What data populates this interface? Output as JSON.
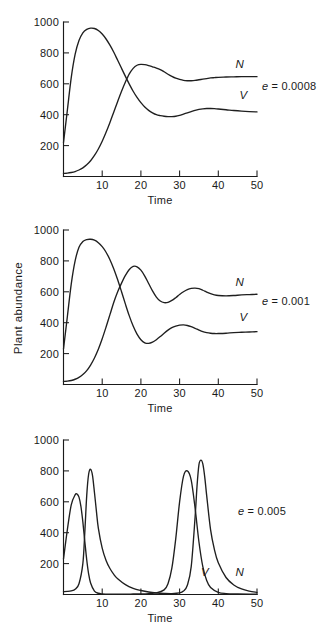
{
  "figure": {
    "name": "plant-abundance-time-series",
    "y_axis_label": "Plant abundance",
    "x_axis_label": "Time",
    "y_ticks": [
      0,
      200,
      400,
      600,
      800,
      1000
    ],
    "y_tick_labels": [
      "",
      "200",
      "400",
      "600",
      "800",
      "1000"
    ],
    "x_ticks": [
      0,
      10,
      20,
      30,
      40,
      50
    ],
    "x_tick_labels": [
      "",
      "10",
      "20",
      "30",
      "40",
      "50"
    ],
    "series_labels": {
      "n": "N",
      "v": "V"
    },
    "line_color": "#1f1f1f"
  },
  "panels": [
    {
      "id": "panel-0",
      "param_prefix": "e",
      "param_eq": " = ",
      "param_value": "0.0008",
      "param_text": "e = 0.0008",
      "show_ylabel": false,
      "label_n": "N",
      "label_v": "V"
    },
    {
      "id": "panel-1",
      "param_prefix": "e",
      "param_eq": " = ",
      "param_value": "0.001",
      "param_text": "e = 0.001",
      "show_ylabel": true,
      "label_n": "N",
      "label_v": "V"
    },
    {
      "id": "panel-2",
      "param_prefix": "e",
      "param_eq": " = ",
      "param_value": "0.005",
      "param_text": "e = 0.005",
      "show_ylabel": false,
      "label_n": "N",
      "label_v": "V"
    }
  ],
  "chart_data": [
    {
      "type": "line",
      "title": "e = 0.0008",
      "xlabel": "Time",
      "ylabel": "",
      "xlim": [
        0,
        50
      ],
      "ylim": [
        0,
        1000
      ],
      "grid": false,
      "legend": "inline-curve-labels",
      "x_ticks": [
        10,
        20,
        30,
        40,
        50
      ],
      "y_ticks": [
        200,
        400,
        600,
        800,
        1000
      ],
      "series": [
        {
          "name": "V",
          "label_position": {
            "x": 46.5,
            "y": 500
          },
          "x": [
            0,
            1,
            2,
            3,
            4,
            5,
            6,
            7,
            8,
            9,
            10,
            11,
            12,
            13,
            14,
            15,
            16,
            17,
            18,
            19,
            20,
            21,
            22,
            23,
            24,
            25,
            26,
            27,
            28,
            29,
            30,
            31,
            32,
            33,
            34,
            35,
            36,
            37,
            38,
            39,
            40,
            42,
            44,
            46,
            48,
            50
          ],
          "y": [
            220,
            430,
            640,
            790,
            880,
            930,
            952,
            960,
            958,
            945,
            922,
            890,
            850,
            804,
            752,
            700,
            648,
            598,
            552,
            512,
            478,
            450,
            428,
            412,
            400,
            394,
            390,
            388,
            388,
            390,
            396,
            404,
            412,
            420,
            428,
            434,
            438,
            440,
            440,
            439,
            437,
            432,
            427,
            423,
            420,
            418
          ]
        },
        {
          "name": "N",
          "label_position": {
            "x": 45.5,
            "y": 700
          },
          "x": [
            0,
            1,
            2,
            3,
            4,
            5,
            6,
            7,
            8,
            9,
            10,
            11,
            12,
            13,
            14,
            15,
            16,
            17,
            18,
            19,
            20,
            21,
            22,
            23,
            24,
            25,
            26,
            27,
            28,
            29,
            30,
            31,
            32,
            33,
            34,
            35,
            36,
            37,
            38,
            39,
            40,
            42,
            44,
            46,
            48,
            50
          ],
          "y": [
            20,
            22,
            26,
            32,
            42,
            56,
            76,
            102,
            136,
            178,
            228,
            286,
            350,
            418,
            486,
            552,
            612,
            664,
            700,
            720,
            726,
            724,
            718,
            710,
            702,
            692,
            678,
            662,
            648,
            636,
            628,
            622,
            620,
            620,
            622,
            626,
            630,
            634,
            638,
            640,
            642,
            644,
            645,
            646,
            646,
            646
          ]
        }
      ]
    },
    {
      "type": "line",
      "title": "e = 0.001",
      "xlabel": "Time",
      "ylabel": "Plant abundance",
      "xlim": [
        0,
        50
      ],
      "ylim": [
        0,
        1000
      ],
      "grid": false,
      "legend": "inline-curve-labels",
      "x_ticks": [
        10,
        20,
        30,
        40,
        50
      ],
      "y_ticks": [
        200,
        400,
        600,
        800,
        1000
      ],
      "series": [
        {
          "name": "V",
          "label_position": {
            "x": 46.5,
            "y": 410
          },
          "x": [
            0,
            1,
            2,
            3,
            4,
            5,
            6,
            7,
            8,
            9,
            10,
            11,
            12,
            13,
            14,
            15,
            16,
            17,
            18,
            19,
            20,
            21,
            22,
            23,
            24,
            25,
            26,
            27,
            28,
            29,
            30,
            31,
            32,
            33,
            34,
            35,
            36,
            37,
            38,
            39,
            40,
            42,
            44,
            46,
            48,
            50
          ],
          "y": [
            230,
            440,
            650,
            800,
            888,
            925,
            938,
            940,
            934,
            918,
            892,
            856,
            808,
            748,
            678,
            600,
            520,
            444,
            378,
            326,
            290,
            270,
            266,
            274,
            290,
            310,
            332,
            352,
            368,
            378,
            384,
            386,
            382,
            374,
            364,
            352,
            342,
            336,
            332,
            330,
            330,
            332,
            336,
            338,
            340,
            342
          ]
        },
        {
          "name": "N",
          "label_position": {
            "x": 45.5,
            "y": 640
          },
          "x": [
            0,
            1,
            2,
            3,
            4,
            5,
            6,
            7,
            8,
            9,
            10,
            11,
            12,
            13,
            14,
            15,
            16,
            17,
            18,
            19,
            20,
            21,
            22,
            23,
            24,
            25,
            26,
            27,
            28,
            29,
            30,
            31,
            32,
            33,
            34,
            35,
            36,
            37,
            38,
            39,
            40,
            42,
            44,
            46,
            48,
            50
          ],
          "y": [
            20,
            22,
            26,
            34,
            46,
            64,
            90,
            126,
            172,
            228,
            296,
            372,
            452,
            532,
            600,
            656,
            706,
            744,
            764,
            762,
            740,
            702,
            654,
            606,
            566,
            540,
            530,
            532,
            544,
            562,
            582,
            600,
            614,
            622,
            624,
            620,
            610,
            598,
            588,
            580,
            576,
            574,
            576,
            580,
            582,
            584
          ]
        }
      ]
    },
    {
      "type": "line",
      "title": "e = 0.005",
      "xlabel": "Time",
      "ylabel": "",
      "xlim": [
        0,
        50
      ],
      "ylim": [
        0,
        1000
      ],
      "grid": false,
      "legend": "inline-curve-labels",
      "x_ticks": [
        10,
        20,
        30,
        40,
        50
      ],
      "y_ticks": [
        200,
        400,
        600,
        800,
        1000
      ],
      "series": [
        {
          "name": "V",
          "label_position": {
            "x": 36.5,
            "y": 120
          },
          "x": [
            0,
            1,
            2,
            3,
            3.5,
            4,
            4.5,
            5,
            5.5,
            6,
            6.5,
            7,
            8,
            9,
            10,
            12,
            14,
            16,
            18,
            20,
            22,
            24,
            26,
            27,
            28,
            29,
            30,
            31,
            32,
            33,
            34,
            35,
            36,
            37,
            38,
            40,
            42,
            45,
            48,
            50
          ],
          "y": [
            230,
            420,
            580,
            645,
            650,
            630,
            570,
            470,
            345,
            225,
            132,
            75,
            22,
            8,
            4,
            2,
            2,
            2,
            3,
            4,
            6,
            10,
            30,
            70,
            170,
            360,
            600,
            765,
            800,
            740,
            560,
            340,
            180,
            90,
            45,
            14,
            6,
            3,
            2,
            2
          ]
        },
        {
          "name": "N",
          "label_position": {
            "x": 45.5,
            "y": 120
          },
          "x": [
            0,
            1,
            2,
            3,
            4,
            5,
            5.5,
            6,
            6.5,
            7,
            7.5,
            8,
            8.5,
            9,
            10,
            11,
            12,
            13,
            14,
            16,
            18,
            20,
            22,
            24,
            26,
            28,
            30,
            31,
            32,
            33,
            34,
            34.5,
            35,
            35.5,
            36,
            36.5,
            37,
            38,
            39,
            40,
            42,
            44,
            46,
            48,
            50
          ],
          "y": [
            18,
            20,
            24,
            34,
            70,
            200,
            400,
            640,
            780,
            810,
            770,
            660,
            540,
            430,
            300,
            220,
            168,
            130,
            102,
            64,
            40,
            26,
            16,
            10,
            7,
            6,
            10,
            22,
            60,
            180,
            500,
            700,
            840,
            870,
            845,
            760,
            640,
            420,
            290,
            205,
            110,
            62,
            36,
            22,
            14
          ]
        }
      ]
    }
  ]
}
